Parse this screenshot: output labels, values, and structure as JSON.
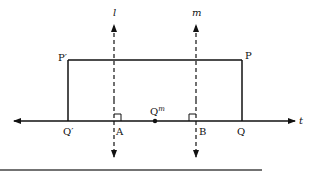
{
  "figure": {
    "type": "geometric-reflection-diagram",
    "lines": [
      {
        "id": "l",
        "label": "l",
        "orientation": "vertical",
        "style": "dashed"
      },
      {
        "id": "m",
        "label": "m",
        "orientation": "vertical",
        "style": "dashed"
      },
      {
        "id": "t",
        "label": "t",
        "orientation": "horizontal",
        "style": "solid"
      }
    ],
    "points": {
      "p_prime": "P′",
      "p": "P",
      "q_prime": "Q′",
      "q": "Q",
      "a": "A",
      "b": "B",
      "q_m": "Q",
      "q_m_sup": "m"
    },
    "labels": {
      "line_l": "l",
      "line_m": "m",
      "line_t": "t"
    },
    "colors": {
      "stroke": "#111111",
      "background": "#ffffff",
      "rule": "#444444"
    }
  }
}
